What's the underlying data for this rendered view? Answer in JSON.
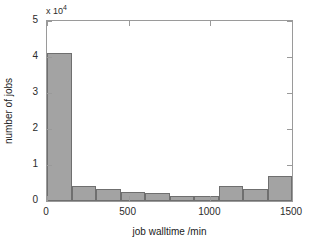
{
  "chart_data": {
    "type": "bar",
    "title": "",
    "subtitle": "",
    "xlabel": "job walltime  /min",
    "ylabel": "number of jobs",
    "y_multiplier_text": "x 10",
    "y_multiplier_exponent": "4",
    "y_multiplier_value": 10000,
    "xlim": [
      0,
      1500
    ],
    "ylim": [
      0,
      5
    ],
    "grid": false,
    "legend": null,
    "x_ticks": [
      0,
      500,
      1000,
      1500
    ],
    "x_tick_labels": [
      "0",
      "500",
      "1000",
      "1500"
    ],
    "y_ticks": [
      0,
      1,
      2,
      3,
      4,
      5
    ],
    "y_tick_labels": [
      "0",
      "1",
      "2",
      "3",
      "4",
      "5"
    ],
    "bin_width": 150,
    "bin_edges": [
      0,
      150,
      300,
      450,
      600,
      750,
      900,
      1050,
      1200,
      1350,
      1500
    ],
    "categories": [
      "0-150",
      "150-300",
      "300-450",
      "450-600",
      "600-750",
      "750-900",
      "900-1050",
      "1050-1200",
      "1200-1350",
      "1350-1500"
    ],
    "values": [
      4.1,
      0.42,
      0.33,
      0.26,
      0.22,
      0.13,
      0.15,
      0.42,
      0.34,
      0.7
    ],
    "values_actual": [
      41000,
      4200,
      3300,
      2600,
      2200,
      1300,
      1500,
      4200,
      3400,
      7000
    ],
    "bar_fill_color": "#a3a3a3",
    "bar_edge_color": "#6f6f6f",
    "axis_color": "#9a9a9a",
    "background_color": "#ffffff"
  }
}
